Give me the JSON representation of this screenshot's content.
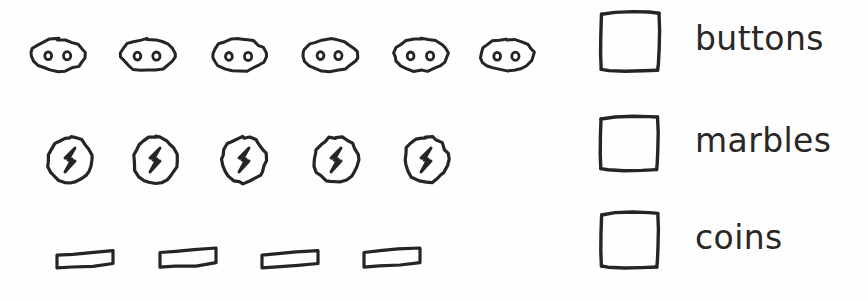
{
  "figure": {
    "type": "hand-drawn pictograph",
    "background_color": "#fefefe",
    "ink_color": "#252525"
  },
  "chart_data": {
    "type": "bar",
    "subtype": "pictograph",
    "title": "",
    "subtitle": "",
    "xlabel": "",
    "ylabel": "",
    "categories": [
      "buttons",
      "marbles",
      "coins"
    ],
    "values": [
      6,
      5,
      4
    ],
    "unit_per_icon": 1,
    "orientation": "horizontal",
    "grid": false,
    "legend_position": "right",
    "xlim": [
      0,
      6
    ],
    "series": [
      {
        "name": "count",
        "values": [
          6,
          5,
          4
        ]
      }
    ],
    "rows": [
      {
        "category": "buttons",
        "count": 6,
        "icon": "button-oval-two-holes",
        "icon_centers_x": [
          58,
          148,
          239,
          330,
          421,
          507
        ],
        "center_y": 55
      },
      {
        "category": "marbles",
        "count": 5,
        "icon": "marble-circle-bolt",
        "icon_centers_x": [
          70,
          155,
          244,
          336,
          426
        ],
        "center_y": 160
      },
      {
        "category": "coins",
        "count": 4,
        "icon": "coin-flat-rect",
        "icon_centers_x": [
          85,
          188,
          290,
          392
        ],
        "center_y": 258
      }
    ]
  },
  "legend": {
    "entries": [
      {
        "label": "buttons",
        "swatch": "hand-drawn-square",
        "top": 8
      },
      {
        "label": "marbles",
        "swatch": "hand-drawn-square",
        "top": 112
      },
      {
        "label": "coins",
        "swatch": "hand-drawn-square",
        "top": 207
      }
    ]
  }
}
